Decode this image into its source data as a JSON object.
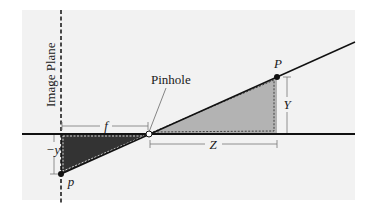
{
  "diagram": {
    "labels": {
      "image_plane": "Image Plane",
      "pinhole": "Pinhole",
      "object_point": "P",
      "image_point": "p",
      "focal_length": "f",
      "depth": "Z",
      "height": "Y",
      "image_height": "−y"
    },
    "colors": {
      "panel": "#f2f2f2",
      "object_triangle": "#b3b3b3",
      "image_triangle": "#333333",
      "line": "#111111",
      "dimension": "#777777"
    }
  }
}
